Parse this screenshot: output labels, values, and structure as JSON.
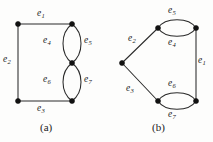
{
  "figure": {
    "width": 213,
    "height": 142,
    "background": "#fdfdfc",
    "ink_color": "#2a2a2a",
    "vertex_color": "#111111"
  },
  "panels": [
    {
      "id": "a",
      "caption": "(a)",
      "caption_x": 40,
      "caption_y": 122,
      "vertices": [
        {
          "name": "a-top-left",
          "x": 18,
          "y": 24
        },
        {
          "name": "a-top-right",
          "x": 72,
          "y": 24
        },
        {
          "name": "a-middle-right",
          "x": 72,
          "y": 63
        },
        {
          "name": "a-bottom-left",
          "x": 18,
          "y": 101
        },
        {
          "name": "a-bottom-right",
          "x": 72,
          "y": 101
        }
      ],
      "edges": [
        {
          "label": "e",
          "sub": "1",
          "name": "edge-e1",
          "path": "M 18 24 L 72 24",
          "label_x": 37,
          "label_y": 9
        },
        {
          "label": "e",
          "sub": "2",
          "name": "edge-e2",
          "path": "M 18 24 L 18 101",
          "label_x": 3,
          "label_y": 55
        },
        {
          "label": "e",
          "sub": "3",
          "name": "edge-e3",
          "path": "M 18 101 L 72 101",
          "label_x": 37,
          "label_y": 104
        },
        {
          "label": "e",
          "sub": "4",
          "name": "edge-e4",
          "path": "M 72 24 C 60 33 60 54 72 63",
          "label_x": 43,
          "label_y": 36
        },
        {
          "label": "e",
          "sub": "5",
          "name": "edge-e5",
          "path": "M 72 24 C 84 33 84 54 72 63",
          "label_x": 84,
          "label_y": 36
        },
        {
          "label": "e",
          "sub": "6",
          "name": "edge-e6",
          "path": "M 72 63 C 60 72 60 92 72 101",
          "label_x": 43,
          "label_y": 75
        },
        {
          "label": "e",
          "sub": "7",
          "name": "edge-e7",
          "path": "M 72 63 C 84 72 84 92 72 101",
          "label_x": 84,
          "label_y": 75
        }
      ]
    },
    {
      "id": "b",
      "caption": "(b)",
      "caption_x": 152,
      "caption_y": 122,
      "vertices": [
        {
          "name": "b-left",
          "x": 122,
          "y": 63
        },
        {
          "name": "b-top-left",
          "x": 158,
          "y": 28
        },
        {
          "name": "b-top-right",
          "x": 196,
          "y": 28
        },
        {
          "name": "b-bottom-left",
          "x": 158,
          "y": 101
        },
        {
          "name": "b-bottom-right",
          "x": 196,
          "y": 101
        }
      ],
      "edges": [
        {
          "label": "e",
          "sub": "2",
          "name": "edge-e2",
          "path": "M 122 63 L 158 28",
          "label_x": 128,
          "label_y": 34
        },
        {
          "label": "e",
          "sub": "3",
          "name": "edge-e3",
          "path": "M 122 63 L 158 101",
          "label_x": 126,
          "label_y": 84
        },
        {
          "label": "e",
          "sub": "5",
          "name": "edge-e5",
          "path": "M 158 28 C 165 17 189 17 196 28",
          "label_x": 168,
          "label_y": 6
        },
        {
          "label": "e",
          "sub": "4",
          "name": "edge-e4",
          "path": "M 158 28 C 165 39 189 39 196 28",
          "label_x": 168,
          "label_y": 38
        },
        {
          "label": "e",
          "sub": "1",
          "name": "edge-e1",
          "path": "M 196 28 L 196 101",
          "label_x": 198,
          "label_y": 56
        },
        {
          "label": "e",
          "sub": "6",
          "name": "edge-e6",
          "path": "M 158 101 C 165 90 189 90 196 101",
          "label_x": 168,
          "label_y": 79
        },
        {
          "label": "e",
          "sub": "7",
          "name": "edge-e7",
          "path": "M 158 101 C 165 112 189 112 196 101",
          "label_x": 168,
          "label_y": 110
        }
      ]
    }
  ]
}
